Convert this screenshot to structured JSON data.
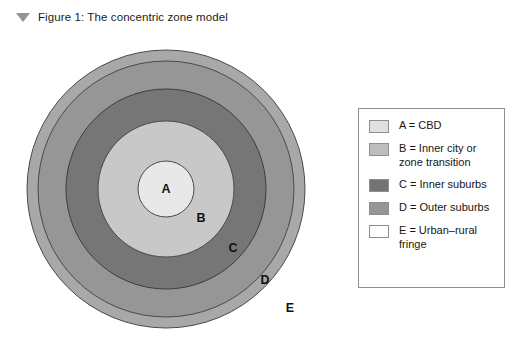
{
  "caption": {
    "marker_icon": "triangle-down-icon",
    "text": "Figure 1: The concentric zone model"
  },
  "diagram": {
    "type": "concentric-zone-model",
    "center": {
      "x": 166,
      "y": 161
    },
    "zones": [
      {
        "id": "E",
        "label": "E",
        "radius": 139,
        "fill": "#a8a8a8",
        "stroke": "#4a4a4a",
        "label_x": 290,
        "label_y": 284
      },
      {
        "id": "D",
        "label": "D",
        "radius": 128,
        "fill": "#969696",
        "stroke": "#4a4a4a",
        "label_x": 265,
        "label_y": 256
      },
      {
        "id": "C",
        "label": "C",
        "radius": 100,
        "fill": "#767676",
        "stroke": "#3d3d3d",
        "label_x": 233,
        "label_y": 224
      },
      {
        "id": "B",
        "label": "B",
        "radius": 68,
        "fill": "#c8c8c8",
        "stroke": "#4a4a4a",
        "label_x": 201,
        "label_y": 194
      },
      {
        "id": "A",
        "label": "A",
        "radius": 28,
        "fill": "#e8e8e8",
        "stroke": "#4a4a4a",
        "label_x": 166,
        "label_y": 165
      }
    ]
  },
  "legend": {
    "items": [
      {
        "key": "A",
        "label": "A = CBD",
        "color": "#e0e0e0"
      },
      {
        "key": "B",
        "label": "B = Inner city or\nzone transition",
        "color": "#bdbdbd"
      },
      {
        "key": "C",
        "label": "C = Inner suburbs",
        "color": "#737373"
      },
      {
        "key": "D",
        "label": "D = Outer suburbs",
        "color": "#969696"
      },
      {
        "key": "E",
        "label": "E = Urban–rural\nfringe",
        "color": "#ffffff"
      }
    ]
  }
}
